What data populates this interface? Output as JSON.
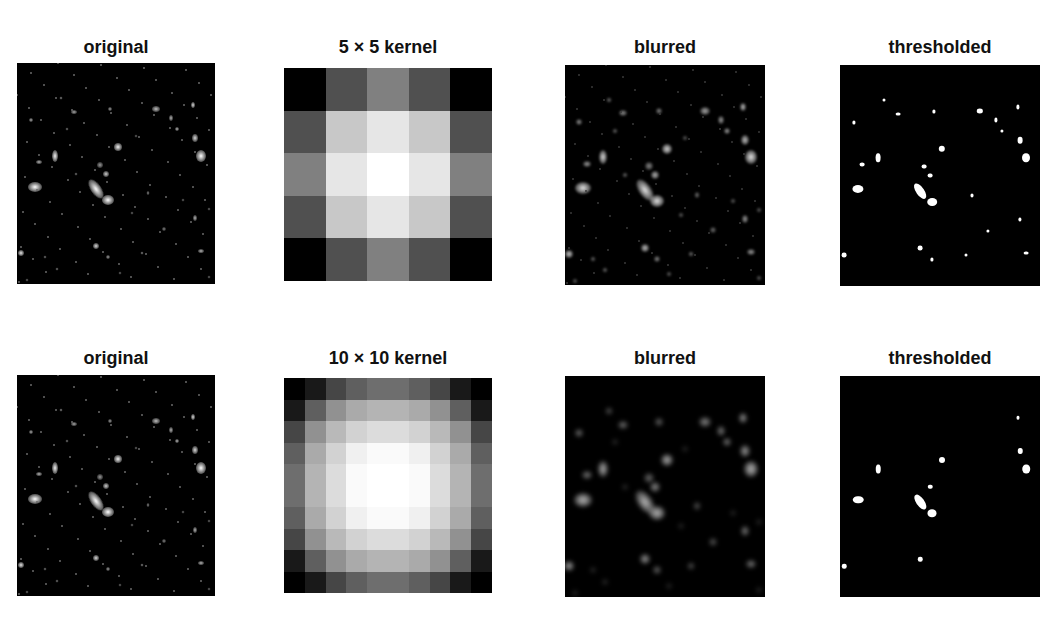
{
  "rows": [
    {
      "panels": [
        {
          "kind": "image",
          "name": "original-image-top",
          "title": "original",
          "box": {
            "x": 17,
            "y": 63,
            "w": 198,
            "h": 221
          },
          "style": "original"
        },
        {
          "kind": "kernel",
          "name": "kernel-5x5",
          "title": "5 × 5 kernel",
          "box": {
            "x": 284,
            "y": 68,
            "w": 208,
            "h": 213
          },
          "size": 5
        },
        {
          "kind": "image",
          "name": "blurred-image-top",
          "title": "blurred",
          "box": {
            "x": 565,
            "y": 65,
            "w": 200,
            "h": 220
          },
          "style": "blurred5"
        },
        {
          "kind": "image",
          "name": "thresholded-image-top",
          "title": "thresholded",
          "box": {
            "x": 840,
            "y": 65,
            "w": 200,
            "h": 221
          },
          "style": "thresh5"
        }
      ],
      "title_y": 37
    },
    {
      "panels": [
        {
          "kind": "image",
          "name": "original-image-bottom",
          "title": "original",
          "box": {
            "x": 17,
            "y": 375,
            "w": 198,
            "h": 221
          },
          "style": "original"
        },
        {
          "kind": "kernel",
          "name": "kernel-10x10",
          "title": "10 × 10 kernel",
          "box": {
            "x": 284,
            "y": 378,
            "w": 208,
            "h": 215
          },
          "size": 10
        },
        {
          "kind": "image",
          "name": "blurred-image-bottom",
          "title": "blurred",
          "box": {
            "x": 565,
            "y": 376,
            "w": 200,
            "h": 221
          },
          "style": "blurred10"
        },
        {
          "kind": "image",
          "name": "thresholded-image-bottom",
          "title": "thresholded",
          "box": {
            "x": 840,
            "y": 376,
            "w": 200,
            "h": 221
          },
          "style": "thresh10"
        }
      ],
      "title_y": 348
    }
  ],
  "kernels": {
    "5": [
      [
        0,
        80,
        128,
        80,
        0
      ],
      [
        80,
        200,
        230,
        200,
        80
      ],
      [
        128,
        230,
        255,
        230,
        128
      ],
      [
        80,
        200,
        230,
        200,
        80
      ],
      [
        0,
        80,
        128,
        80,
        0
      ]
    ],
    "10": [
      [
        0,
        25,
        70,
        95,
        110,
        110,
        95,
        70,
        25,
        0
      ],
      [
        25,
        95,
        145,
        170,
        180,
        180,
        170,
        145,
        95,
        25
      ],
      [
        70,
        145,
        185,
        210,
        220,
        220,
        210,
        185,
        145,
        70
      ],
      [
        95,
        170,
        210,
        240,
        250,
        250,
        240,
        210,
        170,
        95
      ],
      [
        110,
        180,
        220,
        250,
        255,
        255,
        250,
        220,
        180,
        110
      ],
      [
        110,
        180,
        220,
        250,
        255,
        255,
        250,
        220,
        180,
        110
      ],
      [
        95,
        170,
        210,
        240,
        250,
        250,
        240,
        210,
        170,
        95
      ],
      [
        70,
        145,
        185,
        210,
        220,
        220,
        210,
        185,
        145,
        70
      ],
      [
        25,
        95,
        145,
        170,
        180,
        180,
        170,
        145,
        95,
        25
      ],
      [
        0,
        25,
        70,
        95,
        110,
        110,
        95,
        70,
        25,
        0
      ]
    ]
  },
  "sources": [
    {
      "x": 0.09,
      "y": 0.56,
      "rx": 7,
      "ry": 5,
      "b": 1.0
    },
    {
      "x": 0.4,
      "y": 0.57,
      "rx": 5,
      "ry": 11,
      "b": 1.0,
      "rot": -35
    },
    {
      "x": 0.46,
      "y": 0.62,
      "rx": 6,
      "ry": 5,
      "b": 1.0
    },
    {
      "x": 0.19,
      "y": 0.42,
      "rx": 3,
      "ry": 6,
      "b": 0.95
    },
    {
      "x": 0.51,
      "y": 0.38,
      "rx": 4,
      "ry": 4,
      "b": 0.95
    },
    {
      "x": 0.93,
      "y": 0.42,
      "rx": 5,
      "ry": 6,
      "b": 1.0
    },
    {
      "x": 0.9,
      "y": 0.34,
      "rx": 3,
      "ry": 4,
      "b": 0.85
    },
    {
      "x": 0.7,
      "y": 0.21,
      "rx": 4,
      "ry": 3,
      "b": 0.75
    },
    {
      "x": 0.89,
      "y": 0.19,
      "rx": 2,
      "ry": 3,
      "b": 0.85
    },
    {
      "x": 0.78,
      "y": 0.25,
      "rx": 2,
      "ry": 3,
      "b": 0.7
    },
    {
      "x": 0.81,
      "y": 0.3,
      "rx": 2,
      "ry": 2,
      "b": 0.7
    },
    {
      "x": 0.45,
      "y": 0.5,
      "rx": 3,
      "ry": 3,
      "b": 0.8
    },
    {
      "x": 0.42,
      "y": 0.46,
      "rx": 3,
      "ry": 3,
      "b": 0.6
    },
    {
      "x": 0.11,
      "y": 0.45,
      "rx": 3,
      "ry": 2,
      "b": 0.7
    },
    {
      "x": 0.07,
      "y": 0.26,
      "rx": 2,
      "ry": 2,
      "b": 0.65
    },
    {
      "x": 0.29,
      "y": 0.22,
      "rx": 3,
      "ry": 2,
      "b": 0.65
    },
    {
      "x": 0.47,
      "y": 0.21,
      "rx": 2,
      "ry": 2,
      "b": 0.6
    },
    {
      "x": 0.02,
      "y": 0.86,
      "rx": 3,
      "ry": 3,
      "b": 0.9
    },
    {
      "x": 0.4,
      "y": 0.83,
      "rx": 3,
      "ry": 3,
      "b": 0.85
    },
    {
      "x": 0.46,
      "y": 0.88,
      "rx": 2,
      "ry": 2,
      "b": 0.6
    },
    {
      "x": 0.9,
      "y": 0.7,
      "rx": 2,
      "ry": 3,
      "b": 0.7
    },
    {
      "x": 0.93,
      "y": 0.85,
      "rx": 3,
      "ry": 2,
      "b": 0.7
    },
    {
      "x": 0.66,
      "y": 0.59,
      "rx": 1.5,
      "ry": 2,
      "b": 0.5
    },
    {
      "x": 0.74,
      "y": 0.75,
      "rx": 2,
      "ry": 2,
      "b": 0.5
    },
    {
      "x": 0.63,
      "y": 0.86,
      "rx": 1.5,
      "ry": 1.5,
      "b": 0.5
    },
    {
      "x": 0.22,
      "y": 0.16,
      "rx": 1.5,
      "ry": 1.5,
      "b": 0.5
    },
    {
      "x": 0.14,
      "y": 0.88,
      "rx": 1.5,
      "ry": 1.5,
      "b": 0.45
    },
    {
      "x": 0.2,
      "y": 0.93,
      "rx": 1.5,
      "ry": 1.5,
      "b": 0.45
    },
    {
      "x": 0.52,
      "y": 0.95,
      "rx": 1.5,
      "ry": 1.5,
      "b": 0.4
    },
    {
      "x": 0.97,
      "y": 0.97,
      "rx": 1.5,
      "ry": 1.5,
      "b": 0.4
    },
    {
      "x": 0.3,
      "y": 0.5,
      "rx": 1.5,
      "ry": 1.5,
      "b": 0.45
    },
    {
      "x": 0.58,
      "y": 0.68,
      "rx": 1.5,
      "ry": 1.5,
      "b": 0.4
    },
    {
      "x": 0.84,
      "y": 0.62,
      "rx": 1.5,
      "ry": 1.5,
      "b": 0.4
    },
    {
      "x": 0.97,
      "y": 0.66,
      "rx": 1.5,
      "ry": 1.5,
      "b": 0.4
    },
    {
      "x": 0.25,
      "y": 0.3,
      "rx": 1.5,
      "ry": 1.5,
      "b": 0.45
    },
    {
      "x": 0.6,
      "y": 0.33,
      "rx": 1.5,
      "ry": 1.5,
      "b": 0.4
    },
    {
      "x": 0.05,
      "y": 0.98,
      "rx": 1.5,
      "ry": 1.5,
      "b": 0.4
    }
  ]
}
